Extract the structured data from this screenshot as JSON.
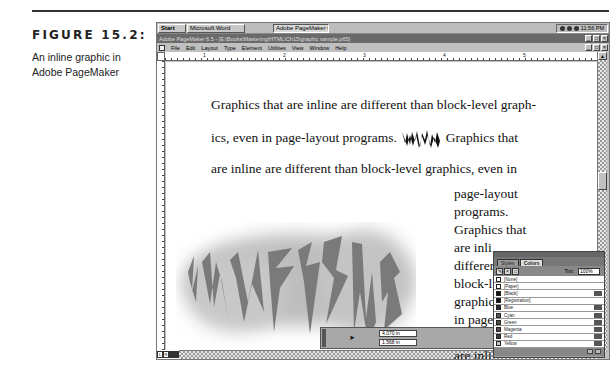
{
  "figure": {
    "label": "FIGURE 15.2:",
    "description": "An inline graphic in Adobe PageMaker"
  },
  "taskbar": {
    "start_label": "Start",
    "tasks": [
      "Microsoft Word",
      "Adobe PageMaker 6.5 - [E..."
    ],
    "clock": "11:56 PM"
  },
  "window": {
    "title": "Adobe PageMaker 6.5 - [E:\\Books\\Mastering\\HTML\\Ch15\\graphic sample.p65]",
    "controls": [
      "_",
      "□",
      "×"
    ]
  },
  "menu": {
    "items": [
      "File",
      "Edit",
      "Layout",
      "Type",
      "Element",
      "Utilities",
      "View",
      "Window",
      "Help"
    ]
  },
  "ruler": {
    "h_labels": [
      "0",
      "1",
      "2",
      "3",
      "4",
      "5",
      "6"
    ]
  },
  "document": {
    "line1": "Graphics that are inline are different than block-level graph-",
    "line2_before": "ics, even in page-layout programs.",
    "line2_after": "Graphics that",
    "line3": "are inline are different than block-level graphics, even in",
    "column_lines": [
      "page-layout",
      "programs.",
      "Graphics that",
      "are inli",
      "differer",
      "block-l",
      "graphic",
      "in page",
      "progra",
      "are inli"
    ],
    "graphic_text": "ADVERTISING"
  },
  "control_palette": {
    "x_value": "4.070 in",
    "y_value": "1.568 in"
  },
  "colors_palette": {
    "tabs": [
      "Styles",
      "Colors"
    ],
    "active_tab": "Colors",
    "tint_label": "Tint:",
    "tint_value": "100%",
    "swatches": [
      {
        "name": "[None]",
        "color": "#ffffff",
        "mode": false
      },
      {
        "name": "[Paper]",
        "color": "#ffffff",
        "mode": false
      },
      {
        "name": "[Black]",
        "color": "#111111",
        "mode": true
      },
      {
        "name": "[Registration]",
        "color": "#111111",
        "mode": false
      },
      {
        "name": "Blue",
        "color": "#2a2a3a",
        "mode": true
      },
      {
        "name": "Cyan",
        "color": "#555a5e",
        "mode": true
      },
      {
        "name": "Green",
        "color": "#4a5048",
        "mode": true
      },
      {
        "name": "Magenta",
        "color": "#5a4a55",
        "mode": true
      },
      {
        "name": "Red",
        "color": "#3a3a3a",
        "mode": true
      },
      {
        "name": "Yellow",
        "color": "#c8c8c0",
        "mode": true
      }
    ]
  }
}
